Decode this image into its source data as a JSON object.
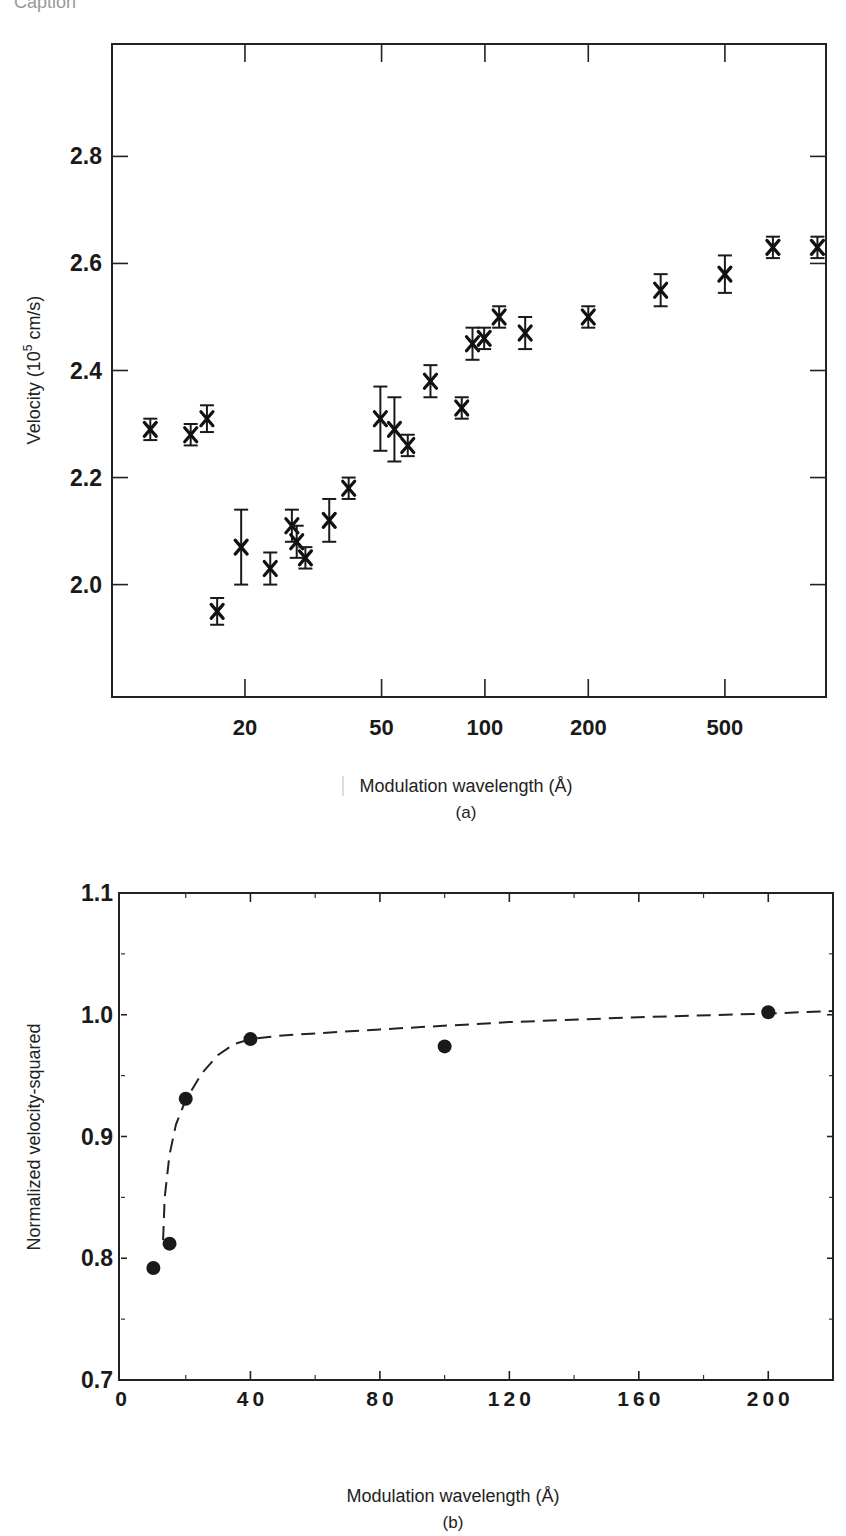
{
  "header": {
    "cutoff_text": "Caption"
  },
  "chart_data": [
    {
      "id": "a",
      "type": "scatter",
      "title": "",
      "panel_label": "(a)",
      "xlabel": "Modulation wavelength (Å)",
      "ylabel": "Velocity (10^5 cm/s)",
      "ylabel_parts": {
        "main": "Velocity (10",
        "sup": "5",
        "tail": " cm/s)"
      },
      "xscale": "log",
      "xlim": [
        8.2,
        985
      ],
      "ylim": [
        1.79,
        3.01
      ],
      "xticks": [
        20,
        50,
        100,
        200,
        500
      ],
      "xtick_labels": [
        "20",
        "50",
        "100",
        "200",
        "500"
      ],
      "yticks": [
        2.0,
        2.2,
        2.4,
        2.6,
        2.8
      ],
      "ytick_labels": [
        "2.0",
        "2.2",
        "2.4",
        "2.6",
        "2.8"
      ],
      "grid": false,
      "marker": "x-with-error-bars",
      "points": [
        {
          "x": 10.6,
          "y": 2.29,
          "err": 0.02
        },
        {
          "x": 13.9,
          "y": 2.28,
          "err": 0.02
        },
        {
          "x": 15.5,
          "y": 2.31,
          "err": 0.025
        },
        {
          "x": 16.6,
          "y": 1.95,
          "err": 0.025
        },
        {
          "x": 19.5,
          "y": 2.07,
          "err": 0.07
        },
        {
          "x": 23.7,
          "y": 2.03,
          "err": 0.03
        },
        {
          "x": 27.4,
          "y": 2.11,
          "err": 0.03
        },
        {
          "x": 28.3,
          "y": 2.08,
          "err": 0.03
        },
        {
          "x": 30.0,
          "y": 2.05,
          "err": 0.02
        },
        {
          "x": 35.2,
          "y": 2.12,
          "err": 0.04
        },
        {
          "x": 40.1,
          "y": 2.18,
          "err": 0.02
        },
        {
          "x": 49.6,
          "y": 2.31,
          "err": 0.06
        },
        {
          "x": 54.5,
          "y": 2.29,
          "err": 0.06
        },
        {
          "x": 59.6,
          "y": 2.26,
          "err": 0.02
        },
        {
          "x": 69.4,
          "y": 2.38,
          "err": 0.03
        },
        {
          "x": 85.6,
          "y": 2.33,
          "err": 0.02
        },
        {
          "x": 92.0,
          "y": 2.45,
          "err": 0.03
        },
        {
          "x": 99.5,
          "y": 2.46,
          "err": 0.02
        },
        {
          "x": 110.0,
          "y": 2.5,
          "err": 0.02
        },
        {
          "x": 131.0,
          "y": 2.47,
          "err": 0.03
        },
        {
          "x": 200.0,
          "y": 2.5,
          "err": 0.02
        },
        {
          "x": 325.0,
          "y": 2.55,
          "err": 0.03
        },
        {
          "x": 500.0,
          "y": 2.58,
          "err": 0.035
        },
        {
          "x": 690.0,
          "y": 2.63,
          "err": 0.02
        },
        {
          "x": 930.0,
          "y": 2.63,
          "err": 0.02
        }
      ]
    },
    {
      "id": "b",
      "type": "scatter",
      "title": "",
      "panel_label": "(b)",
      "xlabel": "Modulation wavelength (Å)",
      "ylabel": "Normalized velocity-squared",
      "xscale": "linear",
      "xlim": [
        0,
        220
      ],
      "ylim": [
        0.7,
        1.1
      ],
      "xticks": [
        0,
        40,
        80,
        120,
        160,
        200
      ],
      "xtick_labels": [
        "0",
        "40",
        "80",
        "120",
        "160",
        "200"
      ],
      "xminor": [
        20,
        60,
        100,
        140,
        180
      ],
      "yticks": [
        0.7,
        0.8,
        0.9,
        1.0,
        1.1
      ],
      "ytick_labels": [
        "0.7",
        "0.8",
        "0.9",
        "1.0",
        "1.1"
      ],
      "yminor": [
        0.75,
        0.85,
        0.95,
        1.05
      ],
      "grid": false,
      "marker": "filled-circle",
      "points": [
        {
          "x": 10,
          "y": 0.792
        },
        {
          "x": 15,
          "y": 0.812
        },
        {
          "x": 20,
          "y": 0.931
        },
        {
          "x": 40,
          "y": 0.98
        },
        {
          "x": 100,
          "y": 0.974
        },
        {
          "x": 200,
          "y": 1.002
        }
      ],
      "fit_curve": {
        "style": "dashed",
        "x": [
          13,
          13.5,
          15,
          17,
          20,
          25,
          30,
          35,
          40,
          50,
          80,
          120,
          160,
          200,
          220
        ],
        "y": [
          0.815,
          0.85,
          0.885,
          0.91,
          0.93,
          0.952,
          0.967,
          0.976,
          0.98,
          0.983,
          0.988,
          0.994,
          0.998,
          1.001,
          1.003
        ]
      }
    }
  ]
}
